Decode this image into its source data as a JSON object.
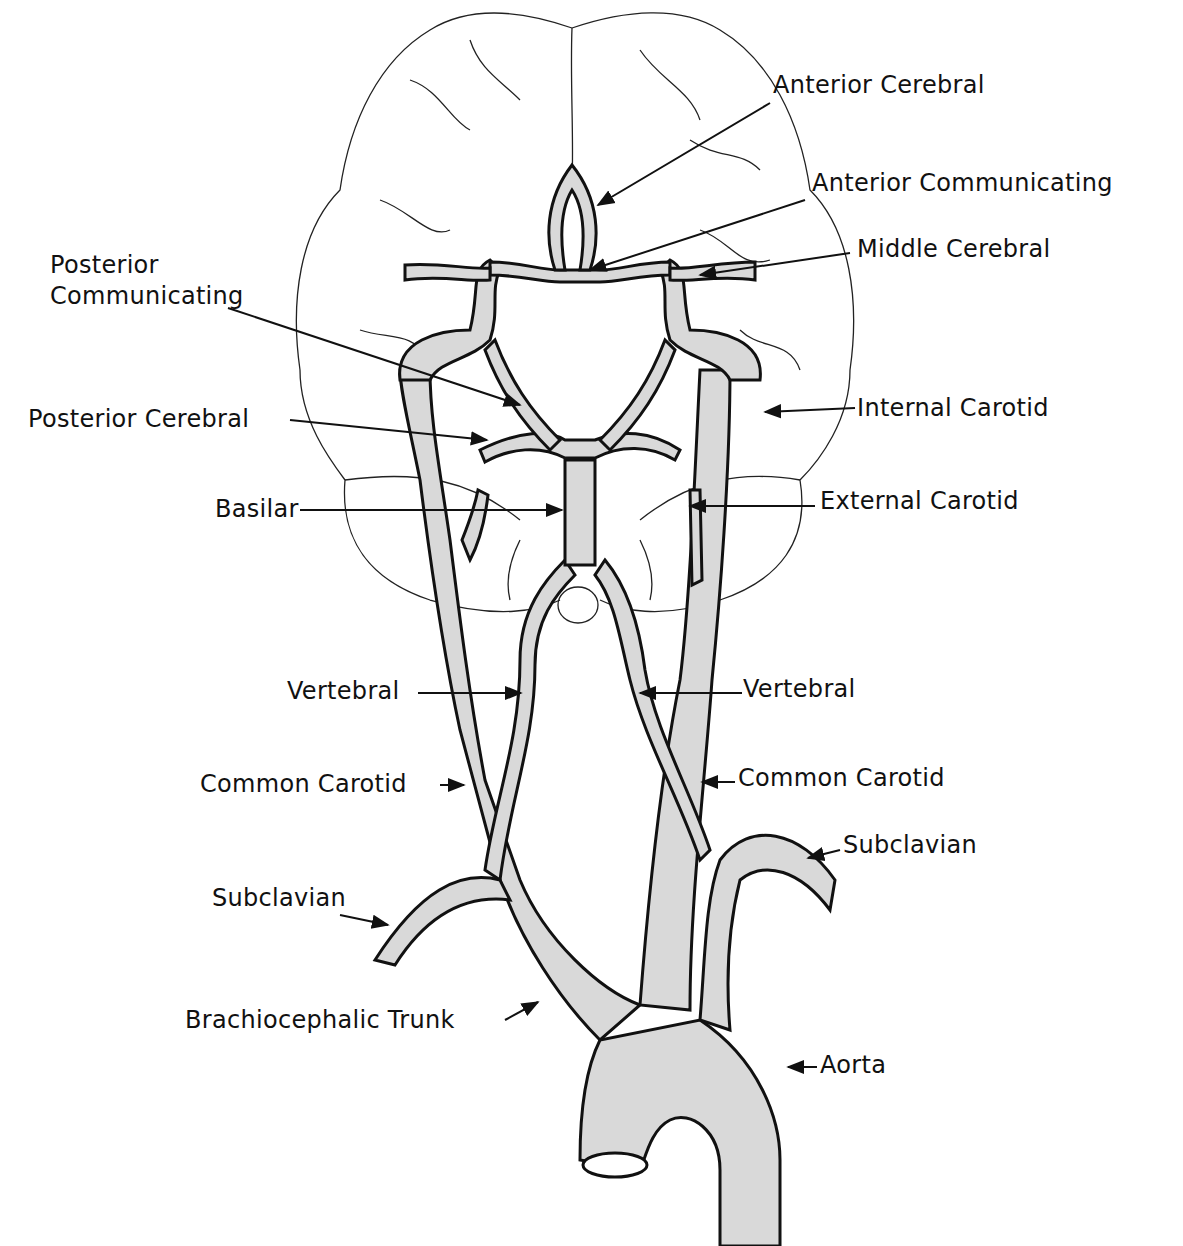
{
  "style": {
    "vessel_fill": "#d9d9d9",
    "line_color": "#111111",
    "background": "#ffffff"
  },
  "labels": {
    "anterior_cerebral": "Anterior Cerebral",
    "anterior_communicating": "Anterior Communicating",
    "middle_cerebral": "Middle Cerebral",
    "posterior_communicating_1": "Posterior",
    "posterior_communicating_2": "Communicating",
    "posterior_cerebral": "Posterior Cerebral",
    "internal_carotid": "Internal Carotid",
    "basilar": "Basilar",
    "external_carotid": "External Carotid",
    "vertebral_left": "Vertebral",
    "vertebral_right": "Vertebral",
    "common_carotid_left": "Common Carotid",
    "common_carotid_right": "Common Carotid",
    "subclavian_left": "Subclavian",
    "subclavian_right": "Subclavian",
    "brachiocephalic_trunk": "Brachiocephalic Trunk",
    "aorta": "Aorta"
  }
}
